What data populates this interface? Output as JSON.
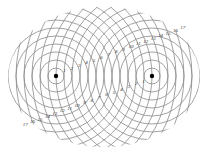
{
  "diagram": {
    "sources": [
      {
        "name": "left-source",
        "cx": 56,
        "cy": 76
      },
      {
        "name": "right-source",
        "cx": 152,
        "cy": 76
      }
    ],
    "ring_spacing": 8,
    "ring_count": 17,
    "colors": {
      "lines": "#8a8a8a",
      "source": "#000000",
      "labels": "#333333",
      "background": "#ffffff"
    },
    "labels_left_path": [
      "1",
      "2",
      "3",
      "4",
      "5",
      "6",
      "7",
      "8",
      "9",
      "10",
      "11",
      "12",
      "13",
      "14",
      "15",
      "16",
      "17"
    ],
    "labels_right_path": [
      "1",
      "2",
      "3",
      "4",
      "5",
      "6",
      "7",
      "8",
      "9",
      "10",
      "11",
      "12",
      "13",
      "14",
      "15",
      "16",
      "17"
    ]
  }
}
